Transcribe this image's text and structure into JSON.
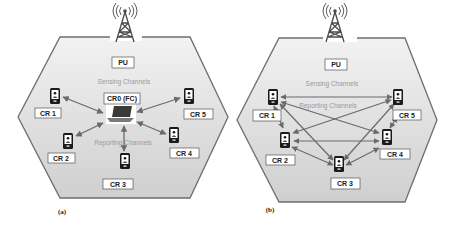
{
  "panels": [
    {
      "id": "a",
      "caption": "(a)",
      "pu_label": "PU",
      "sensing_label": "Sensing Channels",
      "reporting_label": "Reporting Channels",
      "center_label": "CR0 (FC)",
      "nodes": [
        "CR 1",
        "CR 2",
        "CR 3",
        "CR 4",
        "CR 5"
      ]
    },
    {
      "id": "b",
      "caption": "(b)",
      "pu_label": "PU",
      "sensing_label": "Sensing Channels",
      "reporting_label": "Reporting Channels",
      "nodes": [
        "CR 1",
        "CR 2",
        "CR 3",
        "CR 4",
        "CR 5"
      ]
    }
  ],
  "colors": {
    "hexagon_fill": "#dcdcdc",
    "hexagon_stroke": "#6e6e6e",
    "arrow": "#6a6a6a",
    "device": "#1a1a1a",
    "label_box": "#ffffff"
  }
}
